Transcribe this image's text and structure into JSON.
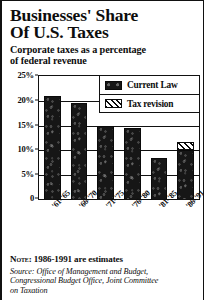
{
  "title": "Businesses' Share\nOf U.S. Taxes",
  "subtitle": "Corporate taxes as a percentage\nof federal revenue",
  "legend": {
    "current_law": "Current Law",
    "tax_revision": "Tax revision",
    "current_law_icon": "solid-black-swatch",
    "tax_revision_icon": "diagonal-hatch-swatch"
  },
  "footer": {
    "note_label": "Note:",
    "note_text": "1986-1991 are estimates",
    "source": "Source: Office of Management and Budget,\nCongressional Budget Office, Joint Committee\non Taxation"
  },
  "chart_data": {
    "type": "bar",
    "title": "Businesses' Share Of U.S. Taxes",
    "subtitle": "Corporate taxes as a percentage of federal revenue",
    "xlabel": "",
    "ylabel": "",
    "ylim": [
      0,
      25
    ],
    "yticks": [
      0,
      5,
      10,
      15,
      20,
      25
    ],
    "ytick_labels": [
      "0",
      "5%",
      "10%",
      "15%",
      "20%",
      "25%"
    ],
    "grid": true,
    "legend_position": "top-right",
    "categories": [
      "'61-'65",
      "'66-'70",
      "'71-'75",
      "'76-'80",
      "'81-'85",
      "'86-'91"
    ],
    "stacked": true,
    "series": [
      {
        "name": "Current Law",
        "values": [
          21.0,
          19.5,
          15.0,
          14.5,
          8.5,
          10.0
        ]
      },
      {
        "name": "Tax revision",
        "values": [
          0,
          0,
          0,
          0,
          0,
          1.6
        ]
      }
    ],
    "totals": [
      21.0,
      19.5,
      15.0,
      14.5,
      8.5,
      11.6
    ],
    "annotations": [
      "1986-1991 are estimates"
    ]
  }
}
